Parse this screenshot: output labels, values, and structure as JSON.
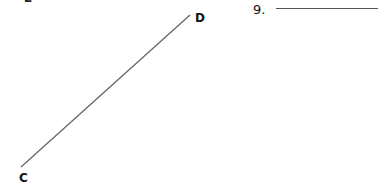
{
  "top_fragment": "2",
  "figure": {
    "segment": {
      "start_label": "C",
      "end_label": "D",
      "start": [
        21,
        167
      ],
      "end": [
        190,
        15
      ],
      "color": "#666666"
    }
  },
  "question": {
    "number": "9.",
    "answer_value": ""
  }
}
